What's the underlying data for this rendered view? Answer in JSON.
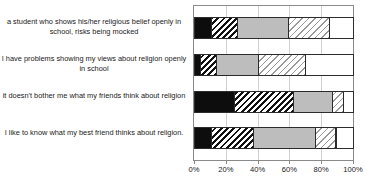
{
  "chart_data": {
    "type": "bar",
    "orientation": "horizontal",
    "stacked": true,
    "normalized": "percent",
    "title": "",
    "xlabel": "",
    "ylabel": "",
    "xlim": [
      0,
      100
    ],
    "xticks": [
      0,
      20,
      40,
      60,
      80,
      100
    ],
    "xticklabels": [
      "0%",
      "20%",
      "40%",
      "60%",
      "80%",
      "100%"
    ],
    "grid": "vertical",
    "legend": "none",
    "categories": [
      "a student who shows his/her religious belief openly in school, risks being mocked",
      "I have problems showing my views about religion openly in school",
      "it doesn't bother me what my friends think about religion",
      "I like to know what my best friend thinks about religion."
    ],
    "series": [
      {
        "name": "segment-1",
        "fill": "solid-black",
        "values": [
          11,
          4,
          25,
          11
        ]
      },
      {
        "name": "segment-2",
        "fill": "hatch-dark",
        "values": [
          16,
          10,
          37,
          26
        ]
      },
      {
        "name": "segment-3",
        "fill": "solid-gray",
        "values": [
          32,
          26,
          25,
          39
        ]
      },
      {
        "name": "segment-4",
        "fill": "hatch-light",
        "values": [
          26,
          30,
          7,
          13
        ]
      },
      {
        "name": "segment-5",
        "fill": "solid-white",
        "values": [
          15,
          30,
          6,
          11
        ]
      }
    ],
    "colors": {
      "solid-black": "#0d0d0d",
      "solid-gray": "#bdbdbd",
      "solid-white": "#ffffff",
      "hatch-dark": "#111111",
      "hatch-light": "#9a9a9a",
      "frame": "#8a8a8a",
      "gridline": "#d0d0d0",
      "text": "#1a1a1a"
    }
  }
}
